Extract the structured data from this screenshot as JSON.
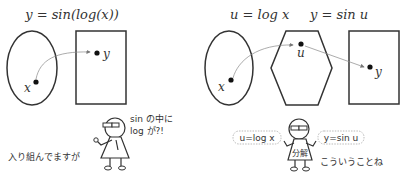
{
  "left_panel": {
    "title": "y = sin(log(x))",
    "domain_label": "x",
    "codomain_label": "y",
    "character": {
      "speech": [
        "sin の中に",
        "log が?!"
      ],
      "caption": "入り組んでますが"
    }
  },
  "right_panel": {
    "title_u": "u = log x",
    "title_y": "y = sin u",
    "domain_label": "x",
    "middle_label": "u",
    "codomain_label": "y",
    "character": {
      "left_bubble": "u=log x",
      "right_bubble": "y=sin u",
      "shirt_text": "分解",
      "caption": "こういうことね"
    }
  },
  "colors": {
    "stroke": "#333333",
    "arrow": "#888888",
    "background": "#ffffff"
  }
}
